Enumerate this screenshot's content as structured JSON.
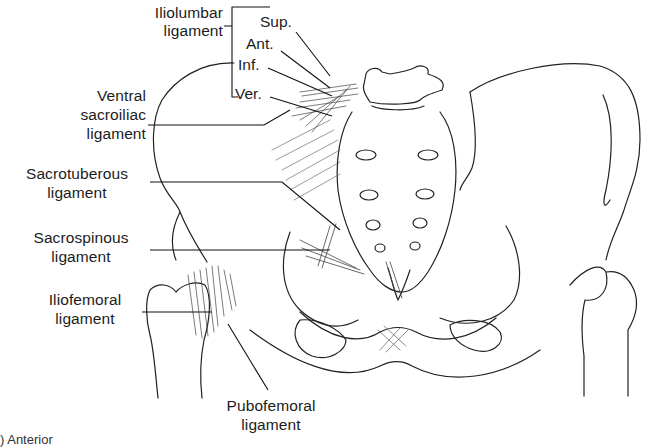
{
  "diagram": {
    "style": "black ink line drawing on white",
    "colors": {
      "background": "#ffffff",
      "ink": "#1c1c1c"
    }
  },
  "labels": {
    "iliolumbar": {
      "line1": "Iliolumbar",
      "line2": "ligament",
      "parts": {
        "sup": "Sup.",
        "ant": "Ant.",
        "inf": "Inf.",
        "ver": "Ver."
      }
    },
    "ventral_sacroiliac": {
      "line1": "Ventral",
      "line2": "sacroiliac",
      "line3": "ligament"
    },
    "sacrotuberous": {
      "line1": "Sacrotuberous",
      "line2": "ligament"
    },
    "sacrospinous": {
      "line1": "Sacrospinous",
      "line2": "ligament"
    },
    "iliofemoral": {
      "line1": "Iliofemoral",
      "line2": "ligament"
    },
    "pubofemoral": {
      "line1": "Pubofemoral",
      "line2": "ligament"
    }
  },
  "caption": {
    "text": ") Anterior"
  }
}
